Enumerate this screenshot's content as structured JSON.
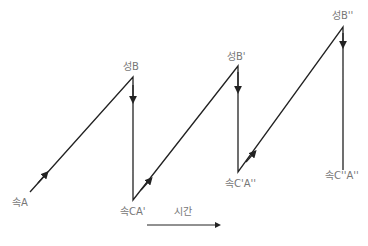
{
  "labels": {
    "a": "속A",
    "b": "성B",
    "ca1": "속CA'",
    "b1": "성B'",
    "c1a2": "속C'A''",
    "b2": "성B''",
    "c2a2": "속C''A''",
    "time": "시간"
  },
  "colors": {
    "line": "#222222",
    "label": "#777777"
  },
  "path_points": [
    [
      30,
      192
    ],
    [
      133,
      77
    ],
    [
      133,
      200
    ],
    [
      238,
      66
    ],
    [
      238,
      172
    ],
    [
      343,
      27
    ],
    [
      343,
      170
    ]
  ]
}
